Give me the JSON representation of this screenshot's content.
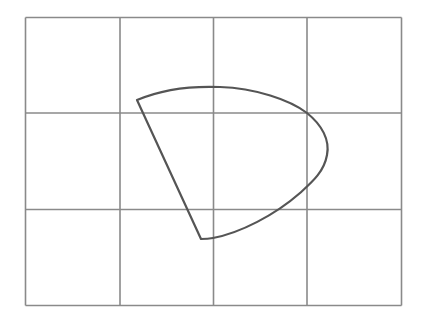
{
  "diagram": {
    "type": "grid-with-closed-curve",
    "background": "#ffffff",
    "grid": {
      "columns": 4,
      "rows": 3,
      "x_lines": [
        25.5,
        120,
        213.5,
        307,
        401.5
      ],
      "y_lines": [
        17.5,
        113,
        209.5,
        305.5
      ],
      "color": "#8a8a8a"
    },
    "shape": {
      "description": "Closed region bounded by two straight edges meeting near grid center-left and a curved arc on the right (fan / sector-like shape)",
      "color": "#555555",
      "vertices": {
        "top_left": [
          137,
          100
        ],
        "bottom": [
          201,
          239
        ],
        "rightmost_point": [
          327,
          150
        ]
      },
      "path": "M 137 100 C 165 88, 195 86, 220 87 C 255 88, 290 100, 307 113 C 322 125, 330 140, 327 155 C 324 172, 312 182, 300 193 C 275 215, 240 233, 213 238 C 208 239, 204 239, 201 239 L 137 100 Z"
    }
  }
}
